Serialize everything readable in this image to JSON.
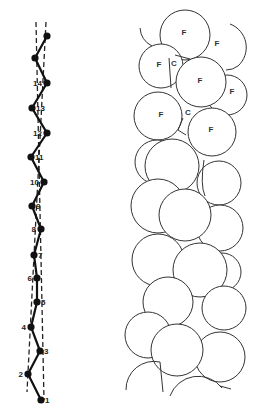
{
  "figure": {
    "left_panel": {
      "description": "zig-zag backbone with numbered nodes between two dashed lines",
      "nodes": [
        {
          "label": "1",
          "x": 41,
          "y": 400
        },
        {
          "label": "2",
          "x": 28,
          "y": 374
        },
        {
          "label": "3",
          "x": 40,
          "y": 351
        },
        {
          "label": "4",
          "x": 31,
          "y": 327
        },
        {
          "label": "5",
          "x": 37,
          "y": 302
        },
        {
          "label": "6",
          "x": 37,
          "y": 278
        },
        {
          "label": "7",
          "x": 34,
          "y": 255
        },
        {
          "label": "8",
          "x": 41,
          "y": 229
        },
        {
          "label": "9",
          "x": 32,
          "y": 206
        },
        {
          "label": "10",
          "x": 44,
          "y": 182
        },
        {
          "label": "11",
          "x": 31,
          "y": 157
        },
        {
          "label": "12",
          "x": 47,
          "y": 133
        },
        {
          "label": "13",
          "x": 32,
          "y": 108
        },
        {
          "label": "14",
          "x": 47,
          "y": 83
        },
        {
          "label": "",
          "x": 35,
          "y": 58
        },
        {
          "label": "",
          "x": 47,
          "y": 36
        }
      ]
    },
    "right_panel": {
      "description": "stack of packed circles",
      "labels": [
        {
          "text": "F",
          "x": 184,
          "y": 35
        },
        {
          "text": "F",
          "x": 217,
          "y": 46
        },
        {
          "text": "F",
          "x": 159,
          "y": 67
        },
        {
          "text": "C",
          "x": 174,
          "y": 66
        },
        {
          "text": "F",
          "x": 200,
          "y": 83
        },
        {
          "text": "F",
          "x": 232,
          "y": 94
        },
        {
          "text": "F",
          "x": 161,
          "y": 117
        },
        {
          "text": "C",
          "x": 188,
          "y": 115
        },
        {
          "text": "F",
          "x": 211,
          "y": 132
        }
      ]
    }
  }
}
